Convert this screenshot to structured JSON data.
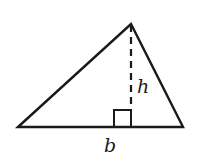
{
  "diagram": {
    "labels": {
      "base": "b",
      "height": "h"
    },
    "colors": {
      "stroke": "#1a1a1a",
      "background": "#ffffff"
    },
    "vertices": {
      "left": [
        18,
        127
      ],
      "apex": [
        131,
        24
      ],
      "right": [
        183,
        127
      ]
    },
    "right_angle_marker": {
      "x": 114,
      "y": 110,
      "size": 17
    }
  }
}
